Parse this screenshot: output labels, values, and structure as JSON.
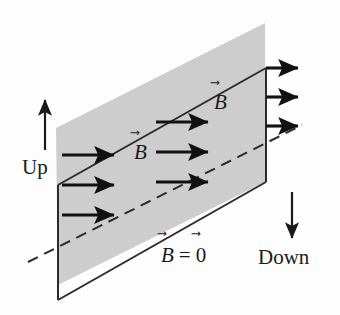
{
  "figure": {
    "type": "physics-vector-field-diagram",
    "width": 340,
    "height": 315,
    "background_color": "#fdfdfd",
    "ink_color": "#1a1a1a",
    "shaded_region_color": "#c9c9c9"
  },
  "labels": {
    "up": "Up",
    "down": "Down",
    "b_field_upper": {
      "symbol": "B",
      "accent": "⃗"
    },
    "b_field_lower": {
      "symbol": "B",
      "accent": "⃗"
    },
    "b_zero": {
      "symbol": "B",
      "equals": "=",
      "value": "0",
      "accent": "⃗"
    }
  },
  "arrow_vec_glyph": "⃗",
  "regions": [
    {
      "name": "field-region",
      "description": "Shaded band above the plane where the magnetic field is non-zero",
      "fill": "#c9c9c9",
      "label": "B"
    },
    {
      "name": "zero-field-region",
      "description": "Unshaded region below the plane where the magnetic field is zero",
      "fill": "#ffffff",
      "label": "B = 0"
    }
  ],
  "geometry": {
    "shaded_polygon": [
      [
        56,
        128
      ],
      [
        265,
        23
      ],
      [
        265,
        182
      ],
      [
        265,
        182
      ],
      [
        58,
        285
      ]
    ],
    "plane_polygon": [
      [
        58,
        185
      ],
      [
        266,
        68
      ],
      [
        266,
        182
      ],
      [
        58,
        300
      ]
    ],
    "dashed_back_edge": [
      [
        28,
        262
      ],
      [
        302,
        125
      ]
    ],
    "plane_stroke": "#2b2b2b",
    "plane_stroke_width": 2.0
  },
  "field_arrows": {
    "count": 12,
    "direction": "right",
    "color": "#111111",
    "groups": [
      {
        "name": "left-column",
        "items": [
          {
            "x1": 62,
            "y1": 155,
            "x2": 120,
            "y2": 155
          },
          {
            "x1": 62,
            "y1": 185,
            "x2": 120,
            "y2": 185
          },
          {
            "x1": 62,
            "y1": 215,
            "x2": 120,
            "y2": 215
          }
        ]
      },
      {
        "name": "middle-column",
        "items": [
          {
            "x1": 156,
            "y1": 122,
            "x2": 214,
            "y2": 122
          },
          {
            "x1": 156,
            "y1": 152,
            "x2": 214,
            "y2": 152
          },
          {
            "x1": 156,
            "y1": 182,
            "x2": 214,
            "y2": 182
          }
        ]
      },
      {
        "name": "right-column",
        "items": [
          {
            "x1": 266,
            "y1": 68,
            "x2": 304,
            "y2": 68
          },
          {
            "x1": 266,
            "y1": 97,
            "x2": 304,
            "y2": 97
          },
          {
            "x1": 266,
            "y1": 126,
            "x2": 304,
            "y2": 126
          }
        ]
      }
    ]
  },
  "orientation_arrows": [
    {
      "name": "up-arrow",
      "x": 45,
      "y1": 150,
      "y2": 96,
      "direction": "up"
    },
    {
      "name": "down-arrow",
      "x": 292,
      "y1": 192,
      "y2": 243,
      "direction": "down"
    }
  ],
  "label_positions": {
    "up": {
      "x": 24,
      "y": 155
    },
    "down": {
      "x": 260,
      "y": 248
    },
    "b_upper": {
      "x": 215,
      "y": 90
    },
    "b_lower": {
      "x": 137,
      "y": 140
    },
    "b_zero": {
      "x": 163,
      "y": 243
    }
  }
}
